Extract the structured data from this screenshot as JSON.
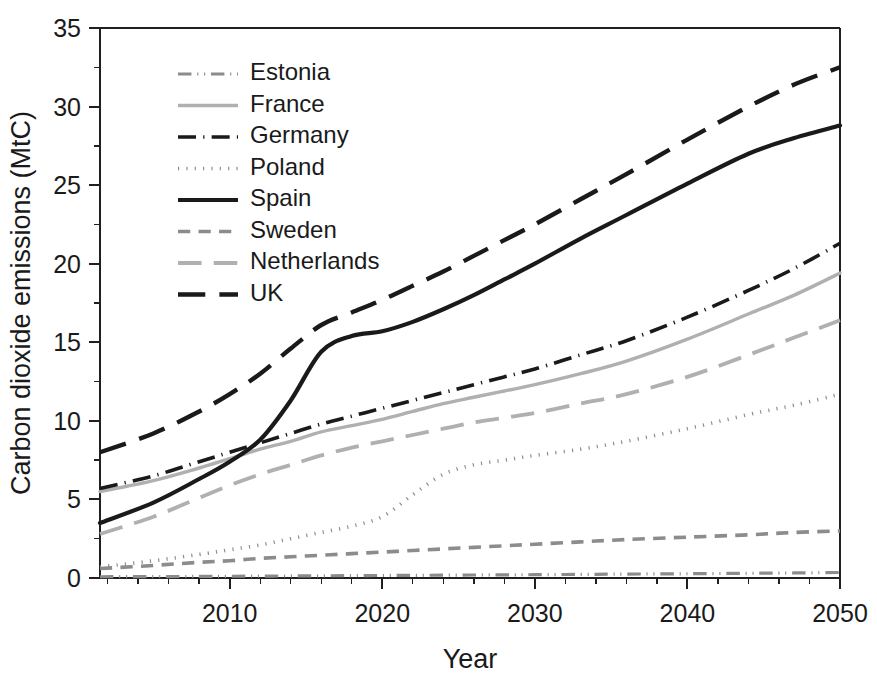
{
  "chart_data": {
    "type": "line",
    "title": "",
    "xlabel": "Year",
    "ylabel": "Carbon dioxide emissions (MtC)",
    "xlim": [
      2001.5,
      2050
    ],
    "ylim": [
      0,
      35
    ],
    "xticks": [
      2010,
      2020,
      2030,
      2040,
      2050
    ],
    "xtick_labels": [
      "2010",
      "2020",
      "2030",
      "2040",
      "2050"
    ],
    "yticks": [
      0,
      5,
      10,
      15,
      20,
      25,
      30,
      35
    ],
    "ytick_labels": [
      "0",
      "5",
      "10",
      "15",
      "20",
      "25",
      "30",
      "35"
    ],
    "grid": false,
    "legend_position": "upper-left-inside",
    "x": [
      2001.5,
      2005,
      2008,
      2010,
      2012,
      2014,
      2016,
      2018,
      2020,
      2022,
      2024,
      2026,
      2028,
      2030,
      2033,
      2036,
      2040,
      2044,
      2047,
      2050
    ],
    "series": [
      {
        "name": "Estonia",
        "color": "#8c8c8c",
        "style": "dash-dot-dot",
        "width": 3.2,
        "values": [
          0.08,
          0.09,
          0.1,
          0.11,
          0.12,
          0.13,
          0.14,
          0.15,
          0.16,
          0.17,
          0.18,
          0.19,
          0.2,
          0.21,
          0.23,
          0.25,
          0.27,
          0.3,
          0.32,
          0.35
        ]
      },
      {
        "name": "France",
        "color": "#b0b0b0",
        "style": "solid",
        "width": 3.4,
        "values": [
          5.5,
          6.2,
          7.0,
          7.6,
          8.2,
          8.7,
          9.3,
          9.7,
          10.1,
          10.6,
          11.1,
          11.5,
          11.9,
          12.3,
          13.0,
          13.8,
          15.2,
          16.8,
          18.0,
          19.4
        ]
      },
      {
        "name": "Germany",
        "color": "#1a1a1a",
        "style": "dash-dot",
        "width": 3.6,
        "values": [
          5.7,
          6.5,
          7.4,
          8.0,
          8.6,
          9.2,
          9.8,
          10.3,
          10.8,
          11.3,
          11.8,
          12.3,
          12.8,
          13.3,
          14.2,
          15.1,
          16.6,
          18.3,
          19.7,
          21.3
        ]
      },
      {
        "name": "Poland",
        "color": "#8c8c8c",
        "style": "dotted",
        "width": 3.6,
        "values": [
          0.7,
          1.1,
          1.5,
          1.8,
          2.1,
          2.5,
          2.9,
          3.3,
          3.9,
          5.3,
          6.6,
          7.2,
          7.5,
          7.8,
          8.2,
          8.7,
          9.5,
          10.4,
          11.0,
          11.7
        ]
      },
      {
        "name": "Spain",
        "color": "#1a1a1a",
        "style": "solid",
        "width": 4.2,
        "values": [
          3.5,
          4.8,
          6.3,
          7.4,
          8.8,
          11.3,
          14.4,
          15.4,
          15.7,
          16.3,
          17.1,
          18.0,
          19.0,
          20.0,
          21.6,
          23.1,
          25.1,
          27.0,
          28.0,
          28.8
        ]
      },
      {
        "name": "Sweden",
        "color": "#8c8c8c",
        "style": "dashed-medium",
        "width": 3.6,
        "values": [
          0.6,
          0.8,
          1.0,
          1.1,
          1.25,
          1.35,
          1.45,
          1.55,
          1.65,
          1.75,
          1.85,
          1.95,
          2.05,
          2.15,
          2.3,
          2.45,
          2.6,
          2.75,
          2.9,
          3.0
        ]
      },
      {
        "name": "Netherlands",
        "color": "#b0b0b0",
        "style": "dashed-long",
        "width": 3.8,
        "values": [
          2.8,
          3.9,
          5.1,
          5.9,
          6.6,
          7.2,
          7.8,
          8.3,
          8.7,
          9.1,
          9.5,
          9.9,
          10.2,
          10.5,
          11.1,
          11.7,
          12.8,
          14.2,
          15.3,
          16.4
        ]
      },
      {
        "name": "UK",
        "color": "#1a1a1a",
        "style": "dashed-long",
        "width": 4.4,
        "values": [
          8.0,
          9.2,
          10.6,
          11.7,
          13.0,
          14.6,
          16.1,
          16.9,
          17.7,
          18.6,
          19.5,
          20.5,
          21.5,
          22.5,
          24.1,
          25.7,
          27.9,
          30.0,
          31.4,
          32.5
        ]
      }
    ]
  },
  "legend": {
    "items": [
      {
        "label": "Estonia"
      },
      {
        "label": "France"
      },
      {
        "label": "Germany"
      },
      {
        "label": "Poland"
      },
      {
        "label": "Spain"
      },
      {
        "label": "Sweden"
      },
      {
        "label": "Netherlands"
      },
      {
        "label": "UK"
      }
    ]
  }
}
